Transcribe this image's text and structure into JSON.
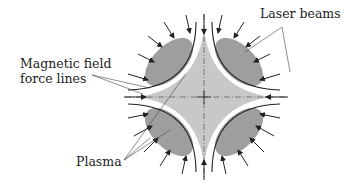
{
  "labels": {
    "laser_beams": "Laser beams",
    "magnetic_field_line1": "Magnetic field",
    "magnetic_field_line2": "force lines",
    "plasma": "Plasma"
  },
  "colors": {
    "plasma_core": "#c8c8c8",
    "plasma_lobes": "#9e9e9e",
    "field_lines": "#222222",
    "arrows": "#222222"
  }
}
